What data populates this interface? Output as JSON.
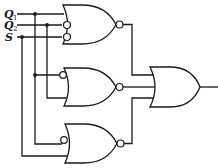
{
  "diagram": {
    "type": "logic-circuit",
    "inputs": [
      {
        "name": "Q",
        "subscript": "1",
        "y": 14
      },
      {
        "name": "Q",
        "subscript": "2",
        "y": 25
      },
      {
        "name": "S",
        "subscript": "",
        "y": 37
      }
    ],
    "gates": [
      {
        "id": "gate-1",
        "type": "NOR",
        "inputs": [
          "Q1",
          "NOT Q2",
          "NOT S"
        ]
      },
      {
        "id": "gate-2",
        "type": "NOR",
        "inputs": [
          "NOT Q1",
          "Q2"
        ]
      },
      {
        "id": "gate-3",
        "type": "NOR",
        "inputs": [
          "NOT Q1",
          "S"
        ]
      },
      {
        "id": "gate-4",
        "type": "OR",
        "inputs": [
          "gate-1",
          "gate-2",
          "gate-3"
        ]
      }
    ],
    "colors": {
      "line": "#1a1a1a",
      "background": "#ffffff"
    }
  }
}
